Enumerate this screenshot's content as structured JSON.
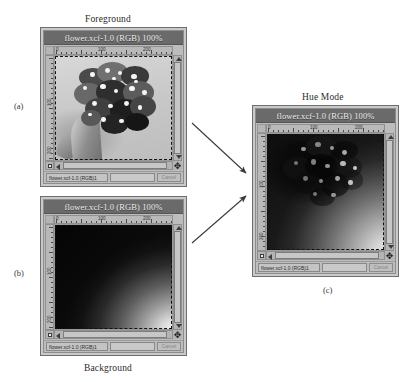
{
  "figure": {
    "labels": {
      "foreground": "Foreground",
      "background": "Background",
      "hue_mode": "Hue Mode",
      "panel_a": "(a)",
      "panel_b": "(b)",
      "panel_c": "(c)"
    }
  },
  "windows": {
    "foreground": {
      "title": "flower.xcf-1.0 (RGB) 100%",
      "status_name": "flower.xcf-1.0 (RGB)1",
      "cancel_label": "Cancel",
      "ruler": {
        "labels": [
          "0",
          "100",
          "200"
        ],
        "v_labels": [
          "100",
          "200"
        ]
      }
    },
    "background": {
      "title": "flower.xcf-1.0 (RGB) 100%",
      "status_name": "flower.xcf-1.0 (RGB)1",
      "cancel_label": "Cancel",
      "ruler": {
        "labels": [
          "0",
          "100",
          "200"
        ],
        "v_labels": [
          "100",
          "200"
        ]
      }
    },
    "result": {
      "title": "flower.xcf-1.0 (RGB) 100%",
      "status_name": "flower.xcf-1.0 (RGB)1",
      "cancel_label": "Cancel",
      "ruler": {
        "labels": [
          "0",
          "100",
          "200"
        ],
        "v_labels": [
          "100",
          "200"
        ]
      }
    }
  },
  "colors": {
    "page_background": "#ffffff",
    "window_frame": "#c9c9c9",
    "titlebar": "#6a6a6a",
    "titlebar_text": "#efefef",
    "arrow": "#3a3a3a"
  }
}
